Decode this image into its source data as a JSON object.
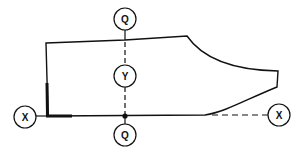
{
  "diagram": {
    "colors": {
      "stroke": "#111111",
      "background": "#ffffff"
    },
    "markers": {
      "top_q": {
        "label": "Q"
      },
      "middle_y": {
        "label": "Y"
      },
      "bottom_q": {
        "label": "Q"
      },
      "left_x": {
        "label": "X"
      },
      "right_x": {
        "label": "X"
      }
    }
  }
}
